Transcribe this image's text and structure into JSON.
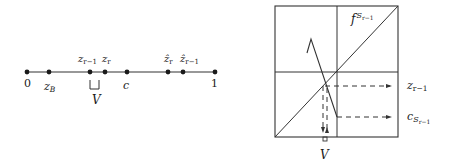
{
  "left_diagram": {
    "points": [
      {
        "id": "p0",
        "x": 27,
        "label": "0",
        "label_pos": "below"
      },
      {
        "id": "pzB",
        "x": 49,
        "label": "z",
        "sub": "B",
        "label_pos": "below"
      },
      {
        "id": "pzr1",
        "x": 90,
        "label": "z",
        "sub": "r−1",
        "label_pos": "above"
      },
      {
        "id": "pzr",
        "x": 105,
        "label": "z",
        "sub": "r",
        "label_pos": "above"
      },
      {
        "id": "pc",
        "x": 127,
        "label": "c",
        "label_pos": "below"
      },
      {
        "id": "phzr",
        "x": 168,
        "label": "ẑ",
        "sub": "r",
        "label_pos": "above"
      },
      {
        "id": "phzr1",
        "x": 183,
        "label": "ẑ",
        "sub": "r−1",
        "label_pos": "above"
      },
      {
        "id": "p1",
        "x": 215,
        "label": "1",
        "label_pos": "below"
      }
    ],
    "interval_label": "V"
  },
  "right_diagram": {
    "function_label": "f",
    "function_sup": "S",
    "function_sup_sub": "r−1",
    "arrow_labels": {
      "z": {
        "label": "z",
        "sub": "r−1"
      },
      "c": {
        "label": "c",
        "sub": "S",
        "subsub": "r−1"
      }
    },
    "bottom_label": "V"
  },
  "colors": {
    "ink": "#1a1a1a",
    "line": "#333333",
    "background": "#ffffff"
  }
}
